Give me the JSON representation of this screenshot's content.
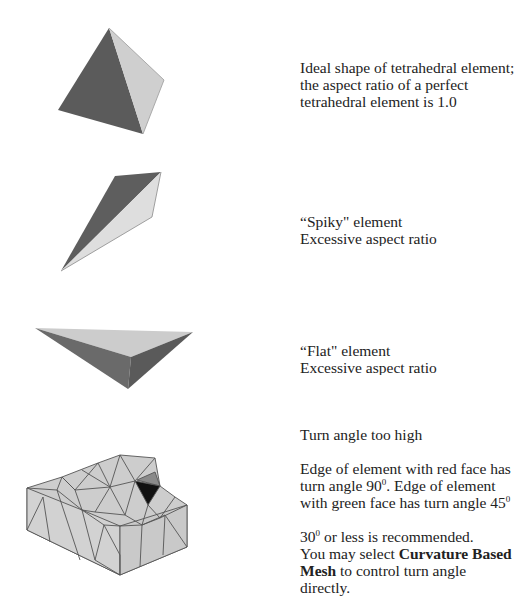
{
  "sections": {
    "ideal": {
      "caption": "Ideal shape of tetrahedral element; the aspect ratio of a perfect tetrahedral element is 1.0"
    },
    "spiky": {
      "title": "“Spiky\" element",
      "subtitle": "Excessive aspect ratio"
    },
    "flat": {
      "title": "“Flat\" element",
      "subtitle": "Excessive aspect ratio"
    },
    "turn": {
      "title": "Turn angle too high",
      "desc_a": "Edge of element with red face has turn angle 90",
      "desc_a_sup": "0",
      "desc_b": ". Edge of element with green face has turn angle 45",
      "desc_b_sup": "0",
      "rec_num": "30",
      "rec_sup": "0",
      "rec_text": " or less is recommended.",
      "hint_pre": "You may select ",
      "hint_bold": "Curvature Based Mesh",
      "hint_post": " to control turn angle directly."
    }
  },
  "colors": {
    "dark_face": "#5a5a5a",
    "light_face": "#cfcfcf",
    "mesh_face": "#cdcdcd",
    "mesh_edge": "#555555",
    "highlight_dark": "#111111",
    "highlight_grey": "#8a8a8a"
  }
}
